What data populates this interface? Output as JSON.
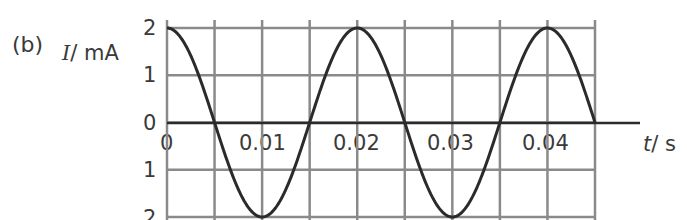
{
  "panel_label": "(b)",
  "y_axis_label": {
    "symbol": "I",
    "unit": "/ mA"
  },
  "x_axis_label": {
    "symbol": "t",
    "unit": "/ s"
  },
  "y_ticks": [
    "2",
    "1",
    "0",
    "1",
    "2"
  ],
  "x_ticks": [
    "0",
    "0.01",
    "0.02",
    "0.03",
    "0.04"
  ],
  "chart_data": {
    "type": "line",
    "title": "",
    "xlabel": "t / s",
    "ylabel": "I / mA",
    "xlim": [
      0,
      0.045
    ],
    "ylim": [
      -2,
      2
    ],
    "grid": true,
    "grid_x_step": 0.005,
    "grid_y_step": 1,
    "series": [
      {
        "name": "I(t) = 2cos(2π·50·t)",
        "amplitude_mA": 2,
        "period_s": 0.02,
        "frequency_Hz": 50,
        "x": [
          0,
          0.005,
          0.01,
          0.015,
          0.02,
          0.025,
          0.03,
          0.035,
          0.04,
          0.045
        ],
        "values": [
          2,
          0,
          -2,
          0,
          2,
          0,
          -2,
          0,
          2,
          0
        ]
      }
    ],
    "colors": {
      "grid": "#8a8a8a",
      "curve": "#2b2b2b",
      "axis": "#2b2b2b"
    }
  }
}
